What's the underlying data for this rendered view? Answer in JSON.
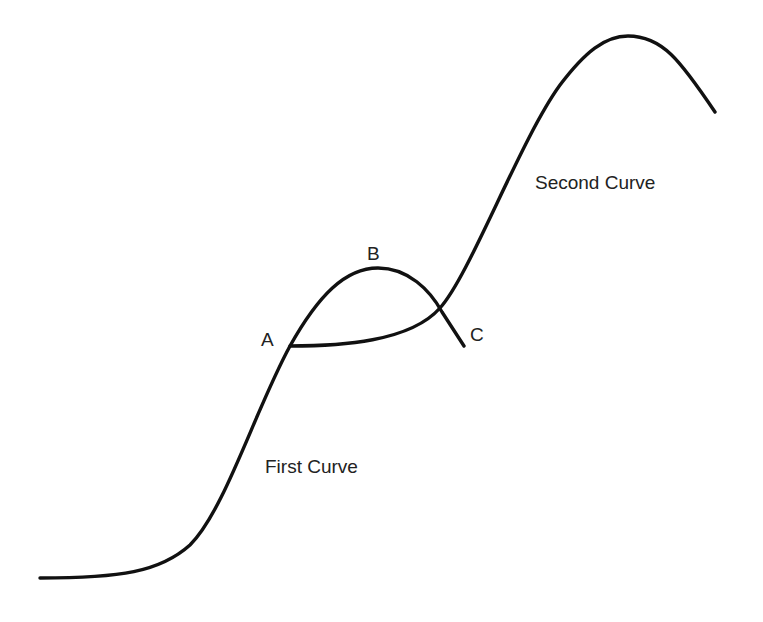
{
  "diagram": {
    "type": "s-curve-transition",
    "curves": [
      {
        "id": "first",
        "label": "First Curve",
        "path_points": [
          [
            40,
            578
          ],
          [
            180,
            560
          ],
          [
            290,
            346
          ],
          [
            375,
            268
          ],
          [
            464,
            346
          ]
        ]
      },
      {
        "id": "second",
        "label": "Second Curve",
        "path_points": [
          [
            290,
            346
          ],
          [
            440,
            308
          ],
          [
            625,
            35
          ],
          [
            715,
            112
          ]
        ]
      }
    ],
    "points": [
      {
        "id": "A",
        "label": "A"
      },
      {
        "id": "B",
        "label": "B"
      },
      {
        "id": "C",
        "label": "C"
      }
    ],
    "colors": {
      "stroke": "#111111",
      "text": "#222222",
      "background": "#ffffff"
    }
  }
}
